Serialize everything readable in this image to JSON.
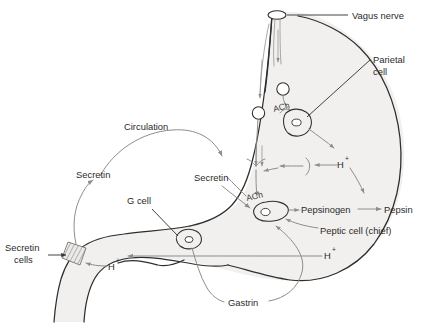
{
  "figure": {
    "type": "biological-pathway-diagram",
    "width": 435,
    "height": 325,
    "background_color": "#ffffff",
    "organ_fill_color": "#f1f0ee",
    "organ_outline_color": "#2e2e2e",
    "pathway_arrow_color": "#8d8d8d",
    "label_text_color": "#2b2b2b"
  },
  "labels": {
    "vagus_nerve": "Vagus nerve",
    "parietal_cell_line1": "Parietal",
    "parietal_cell_line2": "cell",
    "circulation": "Circulation",
    "secretin_left": "Secretin",
    "secretin_right": "Secretin",
    "g_cell": "G cell",
    "secretin_cells_line1": "Secretin",
    "secretin_cells_line2": "cells",
    "pepsinogen": "Pepsinogen",
    "pepsin": "Pepsin",
    "peptic_cell": "Peptic cell (chief)",
    "gastrin": "Gastrin",
    "ach_parietal": "ACh",
    "ach_peptic": "ACh",
    "h_plus_symbol": "H",
    "h_plus_superscript": "+"
  },
  "structures": [
    {
      "name": "esophagus",
      "description": "vertical tube entering stomach at top"
    },
    {
      "name": "stomach-body",
      "description": "large curved gastric lumen"
    },
    {
      "name": "duodenum",
      "description": "lower-left curved outlet"
    },
    {
      "name": "vagus-nerve-trunk",
      "description": "nerve descending through esophagus with ganglion"
    },
    {
      "name": "secretin-cell-patch",
      "description": "hatched band on duodenal wall"
    }
  ],
  "cells": [
    {
      "name": "parietal-cell",
      "neurotransmitter": "ACh",
      "secretes": "H+"
    },
    {
      "name": "peptic-cell-chief",
      "neurotransmitter": "ACh",
      "secretes": "Pepsinogen"
    },
    {
      "name": "g-cell",
      "secretes": "Gastrin"
    },
    {
      "name": "secretin-cells",
      "secretes": "Secretin"
    }
  ],
  "pathways": [
    {
      "from": "Vagus nerve",
      "to": "Parietal cell",
      "mediator": "ACh"
    },
    {
      "from": "Vagus nerve",
      "to": "Peptic cell (chief)",
      "mediator": "ACh"
    },
    {
      "from": "Parietal cell",
      "to": "Lumen",
      "mediator": "H+"
    },
    {
      "from": "Peptic cell (chief)",
      "to": "Pepsinogen",
      "mediator": ""
    },
    {
      "from": "Pepsinogen",
      "to": "Pepsin",
      "mediator": "H+"
    },
    {
      "from": "G cell",
      "to": "Parietal cell",
      "mediator": "Gastrin"
    },
    {
      "from": "Lumen H+",
      "to": "Secretin cells",
      "mediator": "H+"
    },
    {
      "from": "Secretin cells",
      "to": "Circulation",
      "mediator": "Secretin"
    },
    {
      "from": "Circulation",
      "to": "Peptic cell / Parietal cell",
      "mediator": "Secretin"
    }
  ]
}
